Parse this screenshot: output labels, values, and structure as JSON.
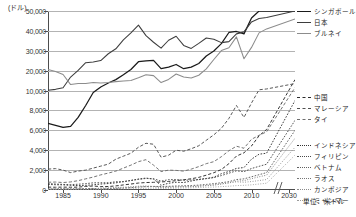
{
  "axes": {
    "y_unit_label": "(ドル)",
    "y_ticks": [
      "0",
      "2,000",
      "4,000",
      "6,000",
      "8,000",
      "10,000",
      "20,000",
      "30,000",
      "40,000",
      "50,000"
    ],
    "x_ticks": [
      "1985",
      "1990",
      "1995",
      "2000",
      "2005",
      "2010",
      "2030"
    ]
  },
  "legend": {
    "group_top": [
      {
        "label": "シンガポール",
        "color": "#1a1a1a",
        "style": "solid",
        "width": 1.3
      },
      {
        "label": "日本",
        "color": "#3d3d3d",
        "style": "solid",
        "width": 1.1
      },
      {
        "label": "ブルネイ",
        "color": "#8c8c8c",
        "style": "solid",
        "width": 1.0
      }
    ],
    "group_mid": [
      {
        "label": "中国",
        "color": "#2b2b2b",
        "style": "dashed-long",
        "width": 1.0
      },
      {
        "label": "マレーシア",
        "color": "#4f4f4f",
        "style": "dashed-long",
        "width": 1.0
      },
      {
        "label": "タイ",
        "color": "#6e6e6e",
        "style": "dashed-long",
        "width": 1.0
      }
    ],
    "group_bottom": [
      {
        "label": "インドネシア",
        "color": "#333333",
        "style": "dotted",
        "width": 1.0
      },
      {
        "label": "フィリピン",
        "color": "#4a4a4a",
        "style": "dotted",
        "width": 1.0
      },
      {
        "label": "ベトナム",
        "color": "#606060",
        "style": "dotted",
        "width": 1.0
      },
      {
        "label": "ラオス",
        "color": "#767676",
        "style": "dotted-fine",
        "width": 1.0
      },
      {
        "label": "カンボジア",
        "color": "#8a8a8a",
        "style": "dotted-fine",
        "width": 1.0
      },
      {
        "label": "ミャンマー",
        "color": "#9c9c9c",
        "style": "dotted-fine",
        "width": 1.0
      }
    ],
    "unit_note": "単位：米ドル"
  },
  "chart_data": {
    "type": "line",
    "title": "",
    "xlabel": "",
    "ylabel": "(ドル)",
    "unit": "単位：米ドル",
    "grid": true,
    "legend_position": "right",
    "axis_note": "y-axis uses a broken (compressed) scale above 10,000; x-axis has a break between 2012 and 2030",
    "ylim": [
      0,
      50000
    ],
    "y_tick_values": [
      0,
      2000,
      4000,
      6000,
      8000,
      10000,
      20000,
      30000,
      40000,
      50000
    ],
    "x": [
      1983,
      1984,
      1985,
      1986,
      1987,
      1988,
      1989,
      1990,
      1991,
      1992,
      1993,
      1994,
      1995,
      1996,
      1997,
      1998,
      1999,
      2000,
      2001,
      2002,
      2003,
      2004,
      2005,
      2006,
      2007,
      2008,
      2009,
      2010,
      2011,
      2012,
      2030
    ],
    "series": [
      {
        "name": "シンガポール",
        "style": "solid",
        "color": "#1a1a1a",
        "values": [
          6700,
          6500,
          6300,
          6400,
          7300,
          8500,
          9800,
          11800,
          13800,
          15500,
          17900,
          20600,
          24500,
          24900,
          25200,
          21000,
          21800,
          23100,
          21000,
          21800,
          23600,
          27400,
          29900,
          33600,
          39200,
          39700,
          38500,
          46500,
          53100,
          54000,
          61000
        ]
      },
      {
        "name": "日本",
        "style": "solid",
        "color": "#3d3d3d",
        "values": [
          10200,
          10600,
          11400,
          16800,
          20200,
          24000,
          24400,
          25100,
          28500,
          31000,
          35500,
          39000,
          42900,
          37600,
          34300,
          31300,
          35300,
          37300,
          32700,
          31200,
          33700,
          36400,
          35800,
          34100,
          34600,
          38500,
          39500,
          44500,
          46200,
          46700,
          57000
        ]
      },
      {
        "name": "ブルネイ",
        "style": "solid",
        "color": "#8c8c8c",
        "values": [
          20600,
          19600,
          18100,
          13000,
          13600,
          13600,
          14100,
          13800,
          14100,
          14500,
          14800,
          15100,
          16400,
          17900,
          17500,
          14000,
          15600,
          18300,
          16800,
          16300,
          17700,
          20900,
          25600,
          30100,
          31500,
          37000,
          26000,
          31700,
          39000,
          41000,
          46000
        ]
      },
      {
        "name": "中国",
        "style": "dashed-long",
        "color": "#2b2b2b",
        "values": [
          290,
          280,
          290,
          280,
          290,
          360,
          400,
          340,
          350,
          410,
          510,
          600,
          700,
          750,
          770,
          810,
          860,
          940,
          1030,
          1130,
          1270,
          1490,
          1740,
          2060,
          2650,
          3410,
          3740,
          4430,
          5450,
          6090,
          15500
        ]
      },
      {
        "name": "マレーシア",
        "style": "dashed-long",
        "color": "#4f4f4f",
        "values": [
          2100,
          2150,
          2000,
          1750,
          1900,
          2000,
          2200,
          2400,
          2600,
          3100,
          3400,
          3700,
          4300,
          4700,
          4600,
          3300,
          3500,
          4000,
          3900,
          4150,
          4450,
          5000,
          5550,
          6200,
          7200,
          8500,
          7300,
          8750,
          10400,
          10800,
          13500
        ]
      },
      {
        "name": "タイ",
        "style": "dashed-long",
        "color": "#6e6e6e",
        "values": [
          780,
          800,
          750,
          810,
          940,
          1120,
          1300,
          1520,
          1700,
          1900,
          2200,
          2500,
          2850,
          3050,
          2500,
          1850,
          2000,
          1970,
          1900,
          2100,
          2350,
          2650,
          2850,
          3350,
          3950,
          4400,
          4200,
          5100,
          5500,
          5850,
          11500
        ]
      },
      {
        "name": "インドネシア",
        "style": "dotted",
        "color": "#333333",
        "values": [
          560,
          530,
          520,
          470,
          440,
          470,
          520,
          600,
          650,
          720,
          840,
          960,
          1100,
          1200,
          1100,
          470,
          680,
          780,
          750,
          900,
          1070,
          1160,
          1290,
          1640,
          1860,
          2170,
          2260,
          3100,
          3600,
          3700,
          9000
        ]
      },
      {
        "name": "フィリピン",
        "style": "dotted",
        "color": "#4a4a4a",
        "values": [
          650,
          600,
          560,
          540,
          580,
          640,
          720,
          730,
          730,
          830,
          840,
          960,
          1070,
          1160,
          1130,
          890,
          1040,
          1050,
          980,
          1010,
          1040,
          1140,
          1240,
          1450,
          1690,
          1930,
          1840,
          2160,
          2380,
          2590,
          7000
        ]
      },
      {
        "name": "ベトナム",
        "style": "dotted",
        "color": "#606060",
        "values": [
          100,
          110,
          120,
          110,
          120,
          140,
          160,
          100,
          140,
          160,
          190,
          230,
          290,
          340,
          360,
          350,
          370,
          400,
          420,
          450,
          490,
          560,
          640,
          730,
          840,
          1050,
          1120,
          1330,
          1540,
          1750,
          6000
        ]
      },
      {
        "name": "ラオス",
        "style": "dotted-fine",
        "color": "#767676",
        "values": [
          90,
          95,
          100,
          95,
          100,
          110,
          120,
          200,
          220,
          250,
          280,
          320,
          380,
          400,
          350,
          260,
          280,
          320,
          330,
          340,
          380,
          430,
          480,
          600,
          720,
          900,
          940,
          1140,
          1330,
          1490,
          5200
        ]
      },
      {
        "name": "カンボジア",
        "style": "dotted-fine",
        "color": "#8a8a8a",
        "values": [
          70,
          75,
          78,
          80,
          85,
          90,
          95,
          100,
          120,
          180,
          230,
          280,
          320,
          330,
          320,
          280,
          290,
          300,
          320,
          340,
          380,
          460,
          530,
          620,
          720,
          820,
          780,
          850,
          950,
          1050,
          4300
        ]
      },
      {
        "name": "ミャンマー",
        "style": "dotted-fine",
        "color": "#9c9c9c",
        "values": [
          60,
          62,
          64,
          58,
          55,
          60,
          65,
          70,
          80,
          90,
          100,
          120,
          150,
          170,
          180,
          160,
          170,
          180,
          200,
          220,
          250,
          280,
          300,
          340,
          380,
          440,
          470,
          520,
          600,
          680,
          3500
        ]
      }
    ]
  }
}
